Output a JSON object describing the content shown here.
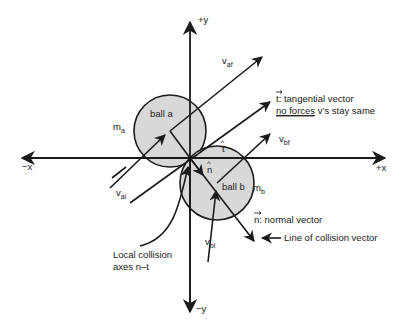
{
  "diagram": {
    "colors": {
      "ball_fill": "#d8d8d8",
      "stroke": "#1a1a1a",
      "text": "#222222",
      "background": "#ffffff"
    },
    "axes": {
      "pos_y": "+y",
      "neg_y": "−y",
      "pos_x": "+x",
      "neg_x": "−x"
    },
    "balls": [
      {
        "id": "a",
        "label": "ball a",
        "mass_main": "m",
        "mass_sub": "a"
      },
      {
        "id": "b",
        "label": "ball b",
        "mass_main": "m",
        "mass_sub": "b"
      }
    ],
    "velocities": [
      {
        "id": "vai",
        "main": "v",
        "sub": "ai"
      },
      {
        "id": "vaf",
        "main": "v",
        "sub": "af"
      },
      {
        "id": "vbi",
        "main": "v",
        "sub": "bi"
      },
      {
        "id": "vbf",
        "main": "v",
        "sub": "bf"
      }
    ],
    "unit_vectors": {
      "t_hat": "t",
      "n_hat": "n"
    },
    "annotations": {
      "tangential_symbol": "t",
      "tangential_text": ": tangential vector",
      "tangential_note_underlined": "no forces",
      "tangential_note_rest": " v’s stay same",
      "normal_symbol": "n",
      "normal_text": ": normal vector",
      "line_of_collision": "Line of collision vector",
      "local_axes_line1": "Local collision",
      "local_axes_line2": "axes n–t"
    }
  }
}
